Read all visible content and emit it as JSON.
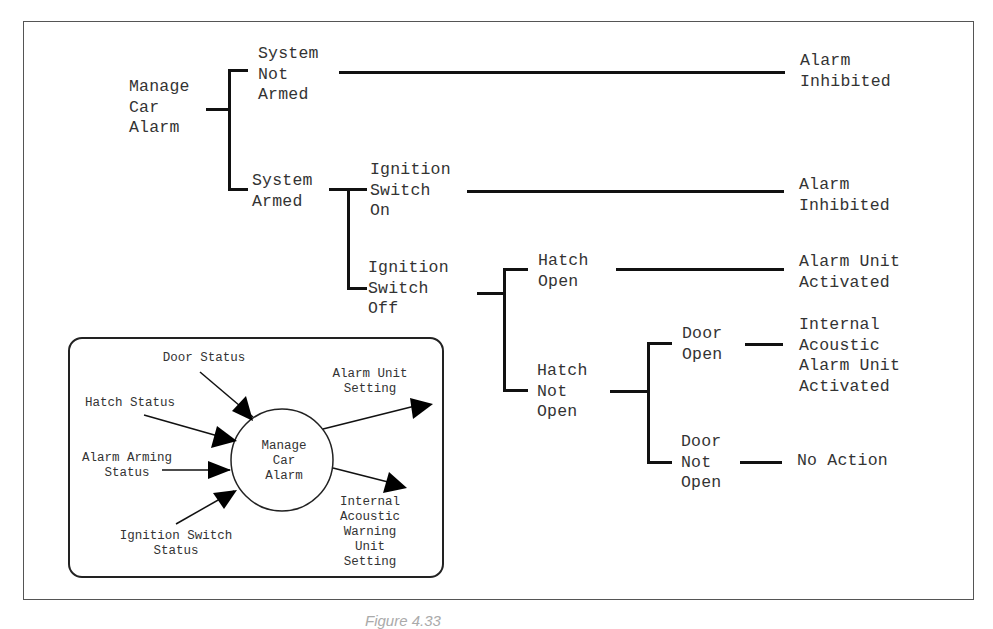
{
  "tree": {
    "root": {
      "label": "Manage\nCar\nAlarm"
    },
    "system_not_armed": {
      "label": "System\nNot\nArmed",
      "outcome": "Alarm\nInhibited"
    },
    "system_armed": {
      "label": "System\nArmed",
      "ignition_on": {
        "label": "Ignition\nSwitch\nOn",
        "outcome": "Alarm\nInhibited"
      },
      "ignition_off": {
        "label": "Ignition\nSwitch\nOff",
        "hatch_open": {
          "label": "Hatch\nOpen",
          "outcome": "Alarm Unit\nActivated"
        },
        "hatch_not_open": {
          "label": "Hatch\nNot\nOpen",
          "door_open": {
            "label": "Door\nOpen",
            "outcome": "Internal\nAcoustic\nAlarm Unit\nActivated"
          },
          "door_not_open": {
            "label": "Door\nNot\nOpen",
            "outcome": "No Action"
          }
        }
      }
    }
  },
  "context_diagram": {
    "process": "Manage\nCar\nAlarm",
    "inputs": [
      "Door Status",
      "Hatch Status",
      "Alarm Arming\nStatus",
      "Ignition Switch\nStatus"
    ],
    "outputs": [
      "Alarm Unit\nSetting",
      "Internal\nAcoustic\nWarning\nUnit\nSetting"
    ]
  },
  "caption": "Figure 4.33"
}
